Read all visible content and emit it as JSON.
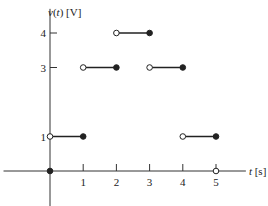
{
  "chart_data": {
    "type": "line",
    "subtype": "piecewise-constant step function",
    "title": "",
    "xlabel": "t [s]",
    "ylabel": "v(t) [V]",
    "xlim": [
      -1.4,
      5.9
    ],
    "ylim": [
      -1.1,
      4.7
    ],
    "grid": false,
    "legend": null,
    "x_ticks": [
      1,
      2,
      3,
      4,
      5
    ],
    "x_tick_labels": [
      "1",
      "2",
      "3",
      "4",
      "5"
    ],
    "y_ticks": [
      1,
      3,
      4
    ],
    "y_tick_labels": [
      "1",
      "3",
      "4"
    ],
    "segments": [
      {
        "x_start": 0,
        "x_end": 1,
        "value": 1,
        "start_marker": "open",
        "end_marker": "closed"
      },
      {
        "x_start": 1,
        "x_end": 2,
        "value": 3,
        "start_marker": "open",
        "end_marker": "closed"
      },
      {
        "x_start": 2,
        "x_end": 3,
        "value": 4,
        "start_marker": "open",
        "end_marker": "closed"
      },
      {
        "x_start": 3,
        "x_end": 4,
        "value": 3,
        "start_marker": "open",
        "end_marker": "closed"
      },
      {
        "x_start": 4,
        "x_end": 5,
        "value": 1,
        "start_marker": "open",
        "end_marker": "closed"
      }
    ],
    "isolated_points": [
      {
        "x": 0,
        "y": 0,
        "marker": "closed"
      },
      {
        "x": 5,
        "y": 0,
        "marker": "open"
      }
    ],
    "colors": {
      "line": "#222222",
      "axis": "#333333"
    }
  }
}
